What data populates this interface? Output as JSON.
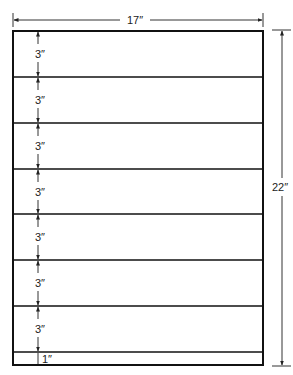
{
  "diagram": {
    "width_label": "17″",
    "height_label": "22″",
    "rows": [
      {
        "label": "3″",
        "inches": 3
      },
      {
        "label": "3″",
        "inches": 3
      },
      {
        "label": "3″",
        "inches": 3
      },
      {
        "label": "3″",
        "inches": 3
      },
      {
        "label": "3″",
        "inches": 3
      },
      {
        "label": "3″",
        "inches": 3
      },
      {
        "label": "3″",
        "inches": 3
      },
      {
        "label": "1″",
        "inches": 1
      }
    ],
    "colors": {
      "line": "#111111",
      "dim": "#333333",
      "background": "#ffffff"
    }
  }
}
